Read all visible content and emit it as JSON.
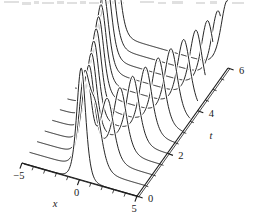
{
  "figure": {
    "title": "",
    "background_color": "#ffffff",
    "line_color": "#1a1a1a",
    "axis_color": "#1a1a1a"
  },
  "axes": {
    "x": {
      "label": "x",
      "ticks": [
        -5,
        0,
        5
      ],
      "tick_labels": [
        "−5",
        "0",
        "5"
      ],
      "minor_tick_step": 1,
      "range": [
        -5,
        5
      ]
    },
    "t": {
      "label": "t",
      "ticks": [
        0,
        2,
        4,
        6
      ],
      "tick_labels": [
        "0",
        "2",
        "4",
        "6"
      ],
      "minor_tick_step": 0.5,
      "range": [
        0,
        6
      ]
    },
    "u": {
      "label": "",
      "range": [
        0,
        1
      ]
    }
  },
  "chart_data": {
    "type": "line",
    "title": "",
    "xlabel": "x",
    "ylabel": "t",
    "zlabel": "",
    "projection": "3d-waterfall",
    "grid": false,
    "legend": null,
    "xlim": [
      -5,
      5
    ],
    "ylim": [
      0,
      6
    ],
    "zlim": [
      0,
      1
    ],
    "x_tick_labels": [
      "−5",
      "0",
      "5"
    ],
    "y_tick_labels": [
      "0",
      "2",
      "4",
      "6"
    ],
    "n_slices": 13,
    "t_slices": [
      0,
      0.5,
      1,
      1.5,
      2,
      2.5,
      3,
      3.5,
      4,
      4.5,
      5,
      5.5,
      6
    ],
    "series": [
      {
        "name": "t=0.0",
        "t": 0.0,
        "peaks": [
          {
            "x": 0.15,
            "height": 1.0,
            "width": 0.52
          }
        ]
      },
      {
        "name": "t=0.5",
        "t": 0.5,
        "peaks": [
          {
            "x": -0.25,
            "height": 0.74,
            "width": 0.6
          },
          {
            "x": 0.72,
            "height": 0.52,
            "width": 0.72
          }
        ]
      },
      {
        "name": "t=1.0",
        "t": 1.0,
        "peaks": [
          {
            "x": -0.7,
            "height": 0.7,
            "width": 0.6
          },
          {
            "x": 1.1,
            "height": 0.56,
            "width": 0.74
          }
        ]
      },
      {
        "name": "t=1.5",
        "t": 1.5,
        "peaks": [
          {
            "x": -1.15,
            "height": 0.7,
            "width": 0.6
          },
          {
            "x": 1.55,
            "height": 0.58,
            "width": 0.74
          }
        ]
      },
      {
        "name": "t=2.0",
        "t": 2.0,
        "peaks": [
          {
            "x": -1.6,
            "height": 0.7,
            "width": 0.6
          },
          {
            "x": 2.0,
            "height": 0.6,
            "width": 0.74
          }
        ]
      },
      {
        "name": "t=2.5",
        "t": 2.5,
        "peaks": [
          {
            "x": -2.05,
            "height": 0.7,
            "width": 0.6
          },
          {
            "x": 2.45,
            "height": 0.6,
            "width": 0.74
          }
        ]
      },
      {
        "name": "t=3.0",
        "t": 3.0,
        "peaks": [
          {
            "x": -2.5,
            "height": 0.7,
            "width": 0.6
          },
          {
            "x": 2.9,
            "height": 0.6,
            "width": 0.74
          }
        ]
      },
      {
        "name": "t=3.5",
        "t": 3.5,
        "peaks": [
          {
            "x": -2.95,
            "height": 0.7,
            "width": 0.6
          },
          {
            "x": 3.35,
            "height": 0.6,
            "width": 0.74
          }
        ]
      },
      {
        "name": "t=4.0",
        "t": 4.0,
        "peaks": [
          {
            "x": -3.4,
            "height": 0.7,
            "width": 0.6
          },
          {
            "x": 3.8,
            "height": 0.6,
            "width": 0.74
          }
        ]
      },
      {
        "name": "t=4.5",
        "t": 4.5,
        "peaks": [
          {
            "x": -3.85,
            "height": 0.7,
            "width": 0.6
          },
          {
            "x": 4.2,
            "height": 0.6,
            "width": 0.74
          }
        ]
      },
      {
        "name": "t=5.0",
        "t": 5.0,
        "peaks": [
          {
            "x": -4.25,
            "height": 0.7,
            "width": 0.6
          },
          {
            "x": 4.55,
            "height": 0.6,
            "width": 0.74
          }
        ]
      },
      {
        "name": "t=5.5",
        "t": 5.5,
        "peaks": [
          {
            "x": -4.6,
            "height": 0.7,
            "width": 0.6
          },
          {
            "x": 4.8,
            "height": 0.6,
            "width": 0.74
          }
        ]
      },
      {
        "name": "t=6.0",
        "t": 6.0,
        "peaks": [
          {
            "x": -4.85,
            "height": 0.7,
            "width": 0.6
          },
          {
            "x": 4.95,
            "height": 0.6,
            "width": 0.74
          }
        ]
      }
    ]
  }
}
